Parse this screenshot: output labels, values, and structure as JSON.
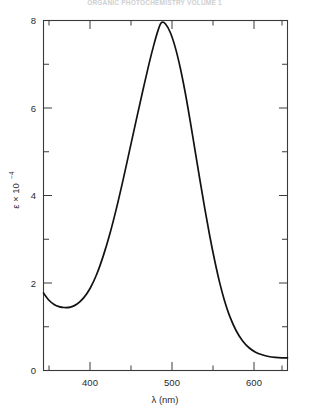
{
  "figure": {
    "top_caption": "ORGANIC PHOTOCHEMISTRY VOLUME 1",
    "caption_visible": "partially-cropped"
  },
  "chart_data": {
    "type": "line",
    "title": "",
    "subtitle": "",
    "xlabel": "λ  (nm)",
    "ylabel": "ε × 10",
    "ylabel_exponent": "−4",
    "xlim": [
      343,
      641
    ],
    "ylim": [
      0,
      8
    ],
    "grid": false,
    "legend": null,
    "x_ticks_major": [
      400,
      500,
      600
    ],
    "x_ticks_major_labels": [
      "400",
      "500",
      "600"
    ],
    "x_ticks_minor": [
      350,
      450,
      550,
      650
    ],
    "y_ticks_major": [
      0,
      2,
      4,
      6,
      8
    ],
    "y_ticks_major_labels": [
      "0",
      "2",
      "4",
      "6",
      "8"
    ],
    "y_ticks_minor": [
      1,
      3,
      5,
      7
    ],
    "peak": {
      "x": 487,
      "y": 7.95
    },
    "local_minimum": {
      "x": 376,
      "y": 1.45
    },
    "series": [
      {
        "name": "absorption spectrum",
        "color": "#121212",
        "x": [
          343,
          350,
          356,
          362,
          368,
          376,
          384,
          392,
          400,
          408,
          416,
          424,
          432,
          440,
          448,
          456,
          464,
          472,
          478,
          483,
          487,
          492,
          498,
          504,
          510,
          516,
          522,
          528,
          534,
          540,
          546,
          552,
          558,
          564,
          570,
          578,
          586,
          594,
          602,
          610,
          618,
          626,
          634,
          641
        ],
        "y": [
          1.77,
          1.6,
          1.51,
          1.46,
          1.44,
          1.45,
          1.52,
          1.66,
          1.88,
          2.2,
          2.62,
          3.12,
          3.7,
          4.34,
          5.02,
          5.7,
          6.37,
          7.02,
          7.46,
          7.78,
          7.95,
          7.92,
          7.72,
          7.38,
          6.92,
          6.36,
          5.72,
          5.04,
          4.36,
          3.7,
          3.08,
          2.52,
          2.02,
          1.6,
          1.26,
          0.92,
          0.68,
          0.52,
          0.42,
          0.36,
          0.32,
          0.3,
          0.29,
          0.29
        ]
      }
    ]
  }
}
